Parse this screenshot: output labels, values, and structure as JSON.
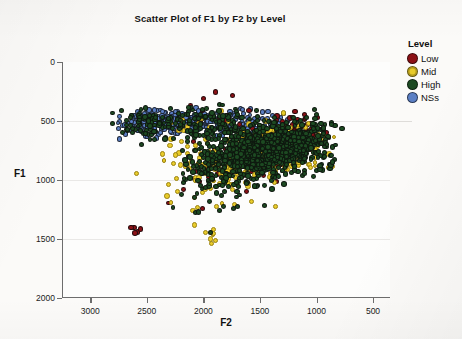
{
  "chart_data": {
    "type": "scatter",
    "title": "Scatter Plot of F1 by F2 by Level",
    "xlabel": "F2",
    "ylabel": "F1",
    "xlim": [
      3250,
      350
    ],
    "ylim": [
      0,
      2000
    ],
    "x_inverted": true,
    "y_inverted": true,
    "xticks": [
      3000,
      2500,
      2000,
      1500,
      1000,
      500
    ],
    "yticks": [
      0,
      500,
      1000,
      1500,
      2000
    ],
    "xtick_labels": [
      "3000",
      "2500",
      "2000",
      "1500",
      "1000",
      "500"
    ],
    "ytick_labels": [
      "0",
      "500",
      "1000",
      "1500",
      "2000"
    ],
    "grid": "horizontal",
    "legend_position": "right",
    "legend_title": "Level",
    "marker": "filled-circle",
    "marker_size_px": 5,
    "series": [
      {
        "name": "Low",
        "color": "#8c1116",
        "n": 210,
        "clusters": [
          {
            "cx": 1380,
            "cy": 720,
            "sx": 230,
            "sy": 150,
            "n": 110
          },
          {
            "cx": 1150,
            "cy": 560,
            "sx": 200,
            "sy": 130,
            "n": 45
          },
          {
            "cx": 1700,
            "cy": 850,
            "sx": 260,
            "sy": 180,
            "n": 30
          },
          {
            "cx": 1900,
            "cy": 420,
            "sx": 300,
            "sy": 150,
            "n": 12
          },
          {
            "cx": 2150,
            "cy": 1000,
            "sx": 280,
            "sy": 220,
            "n": 8
          },
          {
            "cx": 2580,
            "cy": 1420,
            "sx": 90,
            "sy": 60,
            "n": 5
          }
        ]
      },
      {
        "name": "Mid",
        "color": "#e8cb2a",
        "n": 430,
        "clusters": [
          {
            "cx": 1480,
            "cy": 760,
            "sx": 270,
            "sy": 180,
            "n": 220
          },
          {
            "cx": 1800,
            "cy": 900,
            "sx": 280,
            "sy": 200,
            "n": 90
          },
          {
            "cx": 1150,
            "cy": 700,
            "sx": 210,
            "sy": 180,
            "n": 60
          },
          {
            "cx": 2200,
            "cy": 620,
            "sx": 320,
            "sy": 220,
            "n": 30
          },
          {
            "cx": 2050,
            "cy": 1120,
            "sx": 330,
            "sy": 230,
            "n": 22
          },
          {
            "cx": 1900,
            "cy": 1500,
            "sx": 120,
            "sy": 70,
            "n": 8
          }
        ]
      },
      {
        "name": "High",
        "color": "#1d4a22",
        "n": 1150,
        "clusters": [
          {
            "cx": 1500,
            "cy": 750,
            "sx": 300,
            "sy": 185,
            "n": 520
          },
          {
            "cx": 1150,
            "cy": 700,
            "sx": 240,
            "sy": 200,
            "n": 250
          },
          {
            "cx": 1850,
            "cy": 880,
            "sx": 300,
            "sy": 210,
            "n": 180
          },
          {
            "cx": 2050,
            "cy": 520,
            "sx": 360,
            "sy": 130,
            "n": 110
          },
          {
            "cx": 2480,
            "cy": 530,
            "sx": 230,
            "sy": 110,
            "n": 60
          },
          {
            "cx": 1900,
            "cy": 1130,
            "sx": 330,
            "sy": 200,
            "n": 30
          }
        ]
      },
      {
        "name": "NSs",
        "color": "#5b7fc4",
        "n": 430,
        "clusters": [
          {
            "cx": 2150,
            "cy": 510,
            "sx": 310,
            "sy": 85,
            "n": 200
          },
          {
            "cx": 2520,
            "cy": 520,
            "sx": 200,
            "sy": 90,
            "n": 110
          },
          {
            "cx": 1700,
            "cy": 530,
            "sx": 220,
            "sy": 110,
            "n": 70
          },
          {
            "cx": 1400,
            "cy": 540,
            "sx": 170,
            "sy": 130,
            "n": 35
          },
          {
            "cx": 1200,
            "cy": 600,
            "sx": 160,
            "sy": 150,
            "n": 15
          }
        ]
      }
    ]
  },
  "legend": {
    "title": "Level",
    "items": [
      {
        "label": "Low",
        "color": "#8c1116"
      },
      {
        "label": "Mid",
        "color": "#e8cb2a"
      },
      {
        "label": "High",
        "color": "#1d4a22"
      },
      {
        "label": "NSs",
        "color": "#5b7fc4"
      }
    ]
  }
}
